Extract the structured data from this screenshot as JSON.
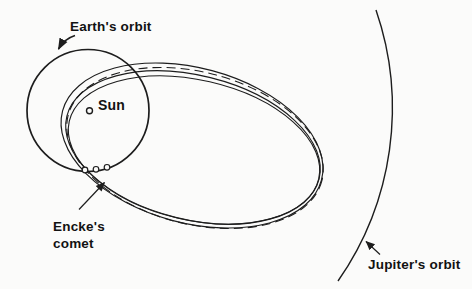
{
  "diagram": {
    "labels": {
      "earth_orbit": "Earth's orbit",
      "sun": "Sun",
      "encke_line1": "Encke's",
      "encke_line2": "comet",
      "jupiter_orbit": "Jupiter's orbit"
    },
    "elements": {
      "comet_orbit_curve_count": 4,
      "comet_orbit_line_styles": [
        "solid",
        "dashed",
        "solid",
        "solid"
      ],
      "comet_position_marker_count": 3
    },
    "colors": {
      "background": "#fbfbfa",
      "line": "#1d1d1d",
      "text": "#121212"
    }
  }
}
